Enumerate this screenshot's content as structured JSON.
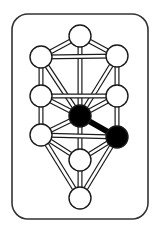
{
  "diagram": {
    "colors": {
      "background": "#ffffff",
      "stroke": "#1a1a1a",
      "node_fill": "#ffffff",
      "highlight_fill": "#000000"
    },
    "frame": {
      "x": 12,
      "y": 14,
      "width": 136,
      "height": 205,
      "radius": 16
    },
    "node_radius": 11,
    "nodes": [
      {
        "id": "kether",
        "x": 80,
        "y": 36,
        "highlighted": false
      },
      {
        "id": "left-upper",
        "x": 41,
        "y": 57,
        "highlighted": false
      },
      {
        "id": "right-upper",
        "x": 117,
        "y": 56,
        "highlighted": false
      },
      {
        "id": "left-middle",
        "x": 41,
        "y": 96,
        "highlighted": false
      },
      {
        "id": "right-middle",
        "x": 117,
        "y": 96,
        "highlighted": false
      },
      {
        "id": "tiphareth",
        "x": 80,
        "y": 116,
        "highlighted": true
      },
      {
        "id": "left-lower",
        "x": 41,
        "y": 135,
        "highlighted": false
      },
      {
        "id": "right-lower",
        "x": 117,
        "y": 137,
        "highlighted": true
      },
      {
        "id": "yesod",
        "x": 80,
        "y": 160,
        "highlighted": false
      },
      {
        "id": "malkuth",
        "x": 80,
        "y": 198,
        "highlighted": false
      }
    ],
    "paths": [
      [
        "kether",
        "left-upper"
      ],
      [
        "kether",
        "right-upper"
      ],
      [
        "kether",
        "tiphareth"
      ],
      [
        "left-upper",
        "right-upper"
      ],
      [
        "left-upper",
        "left-middle"
      ],
      [
        "right-upper",
        "right-middle"
      ],
      [
        "left-upper",
        "tiphareth"
      ],
      [
        "right-upper",
        "tiphareth"
      ],
      [
        "left-middle",
        "right-middle"
      ],
      [
        "left-middle",
        "tiphareth"
      ],
      [
        "right-middle",
        "tiphareth"
      ],
      [
        "left-middle",
        "left-lower"
      ],
      [
        "right-middle",
        "right-lower"
      ],
      [
        "tiphareth",
        "left-lower"
      ],
      [
        "tiphareth",
        "yesod"
      ],
      [
        "left-lower",
        "right-lower"
      ],
      [
        "left-lower",
        "yesod"
      ],
      [
        "right-lower",
        "yesod"
      ],
      [
        "left-lower",
        "malkuth"
      ],
      [
        "right-lower",
        "malkuth"
      ],
      [
        "yesod",
        "malkuth"
      ]
    ],
    "highlighted_paths": [
      [
        "tiphareth",
        "right-lower"
      ]
    ]
  }
}
